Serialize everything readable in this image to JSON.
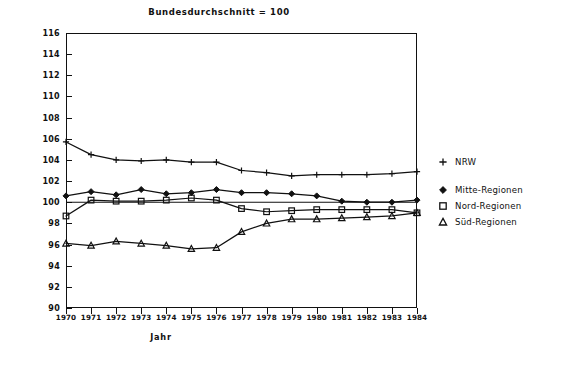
{
  "chart": {
    "title": "Bundesdurchschnitt = 100",
    "xlabel": "Jahr"
  },
  "legend": {
    "items": [
      {
        "label": "NRW",
        "marker": "plus-marker-icon"
      },
      {
        "label": "Mitte-Regionen",
        "marker": "diamond-marker-icon"
      },
      {
        "label": "Nord-Regionen",
        "marker": "square-marker-icon"
      },
      {
        "label": "Süd-Regionen",
        "marker": "triangle-marker-icon"
      }
    ]
  },
  "chart_data": {
    "type": "line",
    "title": "Bundesdurchschnitt = 100",
    "xlabel": "Jahr",
    "ylabel": "",
    "x": [
      1970,
      1971,
      1972,
      1973,
      1974,
      1975,
      1976,
      1977,
      1978,
      1979,
      1980,
      1981,
      1982,
      1983,
      1984
    ],
    "xtick_labels": [
      "1970",
      "1971",
      "1972",
      "1973",
      "1974",
      "1975",
      "1976",
      "1977",
      "1978",
      "1979",
      "1980",
      "1981",
      "1982",
      "1983",
      "1984"
    ],
    "ytick_labels": [
      "90",
      "92",
      "94",
      "96",
      "98",
      "100",
      "102",
      "104",
      "106",
      "108",
      "110",
      "112",
      "114",
      "116"
    ],
    "xlim": [
      1970,
      1984
    ],
    "ylim": [
      90,
      116
    ],
    "ytick_step": 2,
    "grid": false,
    "reference_line": 100,
    "legend_position": "right",
    "series": [
      {
        "name": "NRW",
        "marker": "plus",
        "values": [
          105.7,
          104.5,
          104.0,
          103.9,
          104.0,
          103.8,
          103.8,
          103.0,
          102.8,
          102.5,
          102.6,
          102.6,
          102.6,
          102.7,
          102.9
        ]
      },
      {
        "name": "Mitte-Regionen",
        "marker": "diamond",
        "values": [
          100.6,
          101.0,
          100.7,
          101.2,
          100.8,
          100.9,
          101.2,
          100.9,
          100.9,
          100.8,
          100.6,
          100.1,
          100.0,
          100.0,
          100.2
        ]
      },
      {
        "name": "Nord-Regionen",
        "marker": "square",
        "values": [
          98.7,
          100.2,
          100.1,
          100.1,
          100.2,
          100.4,
          100.2,
          99.4,
          99.1,
          99.2,
          99.3,
          99.3,
          99.3,
          99.3,
          99.0
        ]
      },
      {
        "name": "Süd-Regionen",
        "marker": "triangle",
        "values": [
          96.1,
          95.9,
          96.3,
          96.1,
          95.9,
          95.6,
          95.7,
          97.2,
          98.0,
          98.4,
          98.4,
          98.5,
          98.6,
          98.7,
          99.0
        ]
      }
    ]
  }
}
